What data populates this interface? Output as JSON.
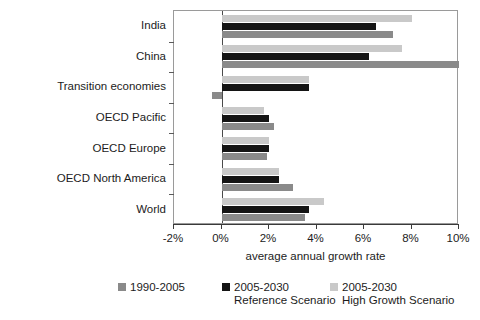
{
  "chart_data": {
    "type": "bar",
    "orientation": "horizontal",
    "title": "",
    "xlabel": "average annual growth rate",
    "ylabel": "",
    "xlim": [
      -2,
      10
    ],
    "xticks": [
      -2,
      0,
      2,
      4,
      6,
      8,
      10
    ],
    "xtick_labels": [
      "-2%",
      "0%",
      "2%",
      "4%",
      "6%",
      "8%",
      "10%"
    ],
    "grid": false,
    "legend_position": "bottom",
    "categories": [
      "India",
      "China",
      "Transition economies",
      "OECD Pacific",
      "OECD Europe",
      "OECD North America",
      "World"
    ],
    "series": [
      {
        "name": "2005-2030 High Growth Scenario",
        "legend_line1": "2005-2030",
        "legend_line2": "High Growth Scenario",
        "color": "#c9c9c9",
        "values": [
          8.0,
          7.6,
          3.7,
          1.8,
          2.0,
          2.4,
          4.3
        ]
      },
      {
        "name": "2005-2030 Reference Scenario",
        "legend_line1": "2005-2030",
        "legend_line2": "Reference Scenario",
        "color": "#141414",
        "values": [
          6.5,
          6.2,
          3.7,
          2.0,
          2.0,
          2.4,
          3.7
        ]
      },
      {
        "name": "1990-2005",
        "legend_line1": "1990-2005",
        "legend_line2": "",
        "color": "#8a8a8a",
        "values": [
          7.2,
          10.0,
          -0.4,
          2.2,
          1.9,
          3.0,
          3.5
        ]
      }
    ]
  }
}
